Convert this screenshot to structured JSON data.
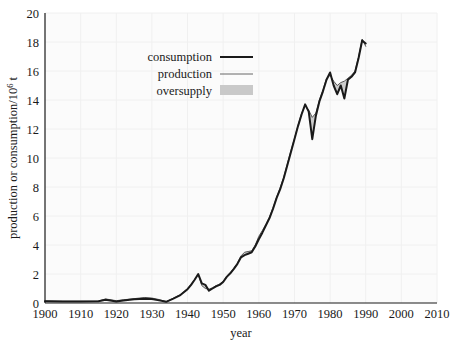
{
  "chart_data": {
    "type": "line",
    "title": "",
    "xlabel": "year",
    "ylabel": "production or consumption/10⁶ t",
    "ylabel_main": "production or consumption/10",
    "ylabel_exp": "6",
    "ylabel_unit": " t",
    "xlim": [
      1900,
      2010
    ],
    "ylim": [
      0,
      20
    ],
    "grid": true,
    "grid_color": "#f0f0f0",
    "legend_position": "upper-left-inset",
    "xticks": [
      1900,
      1910,
      1920,
      1930,
      1940,
      1950,
      1960,
      1970,
      1980,
      1990,
      2000,
      2010
    ],
    "xtick_labels": [
      "1900",
      "1910",
      "1920",
      "1930",
      "1940",
      "1950",
      "1960",
      "1970",
      "1980",
      "1990",
      "2000",
      "2010"
    ],
    "yticks": [
      0,
      2,
      4,
      6,
      8,
      10,
      12,
      14,
      16,
      18,
      20
    ],
    "ytick_labels": [
      "0",
      "2",
      "4",
      "6",
      "8",
      "10",
      "12",
      "14",
      "16",
      "18",
      "20"
    ],
    "legend": [
      {
        "label": "consumption",
        "marker": "thick-line",
        "color": "#1a1a1a"
      },
      {
        "label": "production",
        "marker": "thin-line",
        "color": "#4d4d4d"
      },
      {
        "label": "oversupply",
        "marker": "filled-swatch",
        "color": "#c9c9c9"
      }
    ],
    "x": [
      1900,
      1905,
      1910,
      1915,
      1917,
      1920,
      1922,
      1925,
      1928,
      1930,
      1932,
      1934,
      1936,
      1938,
      1940,
      1941,
      1942,
      1943,
      1944,
      1945,
      1946,
      1947,
      1948,
      1949,
      1950,
      1951,
      1952,
      1953,
      1954,
      1955,
      1956,
      1957,
      1958,
      1959,
      1960,
      1961,
      1962,
      1963,
      1964,
      1965,
      1966,
      1967,
      1968,
      1969,
      1970,
      1971,
      1972,
      1973,
      1974,
      1975,
      1976,
      1977,
      1978,
      1979,
      1980,
      1981,
      1982,
      1983,
      1984,
      1985,
      1986,
      1987,
      1988,
      1989,
      1990
    ],
    "series": [
      {
        "name": "consumption",
        "color": "#1a1a1a",
        "width": 2.0,
        "values": [
          0.12,
          0.1,
          0.1,
          0.12,
          0.22,
          0.1,
          0.18,
          0.26,
          0.3,
          0.28,
          0.18,
          0.08,
          0.3,
          0.55,
          0.95,
          1.25,
          1.6,
          2.0,
          1.35,
          1.25,
          0.85,
          1.0,
          1.15,
          1.25,
          1.45,
          1.8,
          2.05,
          2.35,
          2.7,
          3.15,
          3.3,
          3.4,
          3.5,
          3.9,
          4.4,
          4.85,
          5.35,
          5.85,
          6.5,
          7.25,
          7.85,
          8.6,
          9.5,
          10.4,
          11.3,
          12.2,
          13.0,
          13.7,
          13.2,
          11.3,
          12.9,
          13.9,
          14.6,
          15.4,
          15.9,
          15.0,
          14.4,
          15.0,
          14.1,
          15.4,
          15.6,
          15.9,
          16.9,
          18.1,
          17.9
        ]
      },
      {
        "name": "production",
        "color": "#555555",
        "width": 1.0,
        "values": [
          0.14,
          0.12,
          0.12,
          0.13,
          0.28,
          0.16,
          0.22,
          0.3,
          0.38,
          0.34,
          0.24,
          0.1,
          0.32,
          0.58,
          1.0,
          1.3,
          1.62,
          1.95,
          1.2,
          1.0,
          0.95,
          1.05,
          1.2,
          1.3,
          1.5,
          1.85,
          2.1,
          2.4,
          2.75,
          3.25,
          3.5,
          3.55,
          3.6,
          4.0,
          4.6,
          5.0,
          5.45,
          5.95,
          6.6,
          7.3,
          7.95,
          8.7,
          9.6,
          10.5,
          11.35,
          12.25,
          13.1,
          13.6,
          13.3,
          12.8,
          13.1,
          14.0,
          14.7,
          15.5,
          15.7,
          15.3,
          15.0,
          15.2,
          15.3,
          15.5,
          15.7,
          16.0,
          17.0,
          18.2,
          17.7
        ]
      }
    ]
  },
  "axis": {
    "x_title": "year",
    "y_title_main": "production or consumption/10",
    "y_title_sup": "6",
    "y_title_tail": " t"
  }
}
